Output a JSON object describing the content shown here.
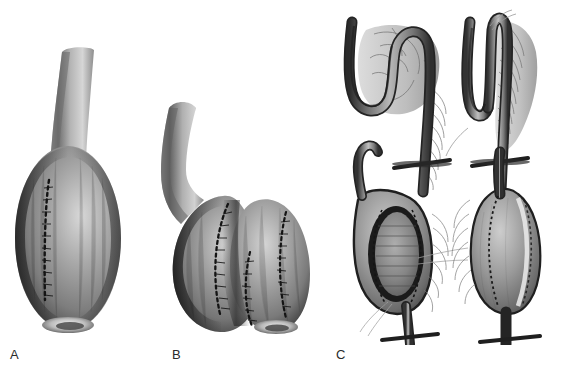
{
  "figure": {
    "kind": "surgical-illustration",
    "background_color": "#ffffff",
    "width_px": 574,
    "height_px": 371,
    "rendering": "grayscale airbrush line drawing",
    "ink_colors": {
      "outline_dark": "#1e1e1e",
      "tissue_mid": "#8a8a8a",
      "tissue_light": "#c9c9c9",
      "shadow": "#3a3a3a",
      "highlight": "#f0f0f0",
      "label_text": "#2b2b2b"
    }
  },
  "panels": [
    {
      "id": "A",
      "label": "A",
      "label_x": 10,
      "label_y": 348,
      "description": "Single-lobed reservoir with tubular neck and a vertical interrupted suture line",
      "features": {
        "neck": "curved tubular limb",
        "body": "single ovoid pouch",
        "suture_line": "vertical dotted/interrupted staple line",
        "base": "light elliptical highlight at inferior pole"
      }
    },
    {
      "id": "B",
      "label": "B",
      "label_x": 172,
      "label_y": 348,
      "description": "Bilobed reservoir with tubular neck and three interrupted suture lines",
      "features": {
        "neck": "curved tubular limb entering from upper left",
        "body": "two fused ovoid lobes",
        "suture_lines": "three vertical dotted staple lines",
        "base": "light elliptical highlight at inferior pole"
      }
    },
    {
      "id": "C",
      "label": "C",
      "label_x": 336,
      "label_y": 348,
      "description": "Four-step sequence of reservoir construction from a folded bowel loop with mesentery",
      "steps": [
        {
          "index": 1,
          "position": "top-left",
          "caption_visible": false,
          "description": "S-shaped serpentine bowel loop with mesentery and vascular arcade"
        },
        {
          "index": 2,
          "position": "top-right",
          "caption_visible": false,
          "description": "Loop folded into a U / side-by-side apposition with mesentery laid posteriorly"
        },
        {
          "index": 3,
          "position": "bottom-left",
          "caption_visible": false,
          "description": "Antimesenteric borders opened and sutured, inner pouch cavity exposed"
        },
        {
          "index": 4,
          "position": "bottom-right",
          "caption_visible": false,
          "description": "Completed closed reservoir with efferent limb"
        }
      ]
    }
  ],
  "labels": {
    "a": "A",
    "b": "B",
    "c": "C"
  }
}
